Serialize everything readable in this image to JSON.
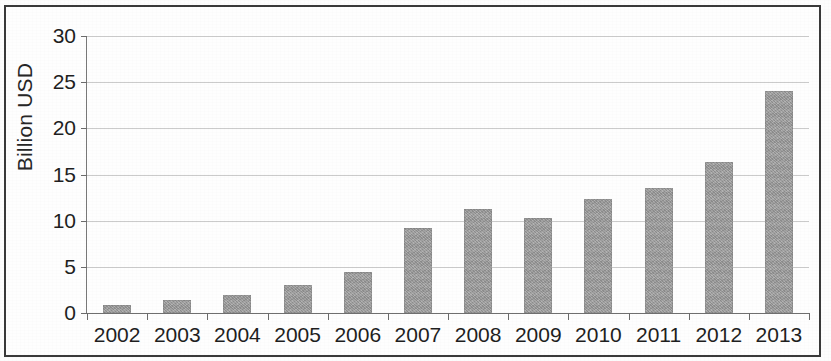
{
  "chart_data": {
    "type": "bar",
    "title": "",
    "subtitle": "",
    "xlabel": "",
    "ylabel": "Billion USD",
    "categories": [
      "2002",
      "2003",
      "2004",
      "2005",
      "2006",
      "2007",
      "2008",
      "2009",
      "2010",
      "2011",
      "2012",
      "2013"
    ],
    "values": [
      0.9,
      1.4,
      1.9,
      3.0,
      4.4,
      9.2,
      11.3,
      10.3,
      12.4,
      13.5,
      16.4,
      24.0
    ],
    "series": [
      {
        "name": "Billion USD",
        "values": [
          0.9,
          1.4,
          1.9,
          3.0,
          4.4,
          9.2,
          11.3,
          10.3,
          12.4,
          13.5,
          16.4,
          24.0
        ]
      }
    ],
    "ylim": [
      0,
      30
    ],
    "yticks": [
      0,
      5,
      10,
      15,
      20,
      25,
      30
    ],
    "ytick_labels": [
      "0",
      "5",
      "10",
      "15",
      "20",
      "25",
      "30"
    ],
    "grid": true,
    "grid_axis": "y",
    "legend": false,
    "legend_position": "none",
    "bar_color": "#9a9a9a",
    "axis_color": "#6b6b6b",
    "grid_color": "#b9b9b9",
    "text_color": "#1f1f1f",
    "border_color": "#3a3a3a",
    "background": "#fefefe",
    "annotations": []
  }
}
